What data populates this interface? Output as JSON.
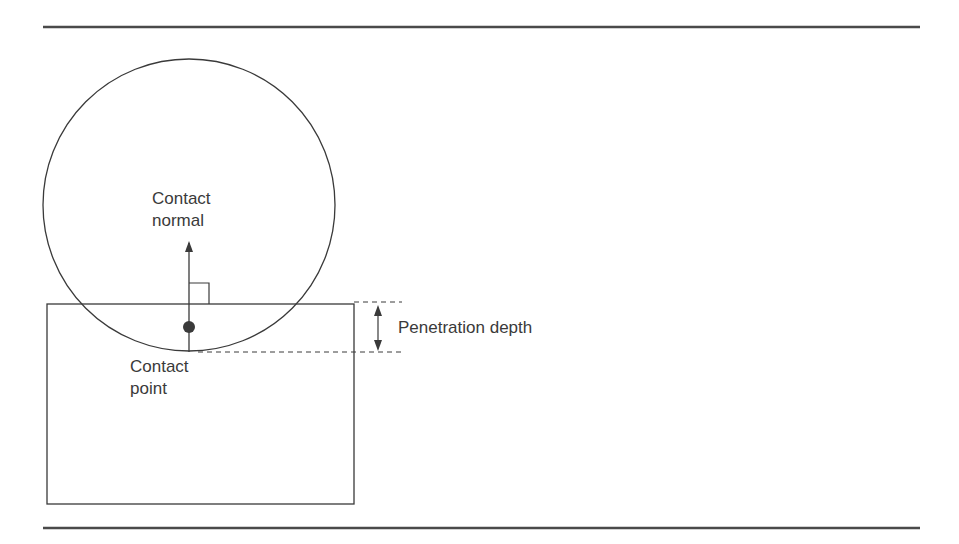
{
  "diagram": {
    "labels": {
      "contact_normal": [
        "Contact",
        "normal"
      ],
      "contact_point": [
        "Contact",
        "point"
      ],
      "penetration_depth": "Penetration depth"
    },
    "shapes": {
      "circle": {
        "cx": 189,
        "cy": 205,
        "r": 146
      },
      "box": {
        "x": 47,
        "y": 304,
        "width": 307,
        "height": 200
      },
      "contact_point": {
        "cx": 189,
        "cy": 327,
        "r": 6
      },
      "normal_arrow": {
        "x": 189,
        "y_start": 352,
        "y_end": 243
      },
      "penetration_arrow": {
        "x": 378,
        "y_top": 304,
        "y_bottom": 352
      }
    },
    "colors": {
      "stroke": "#3a3a3a",
      "rule": "#4a4a4a",
      "background": "#ffffff"
    }
  }
}
